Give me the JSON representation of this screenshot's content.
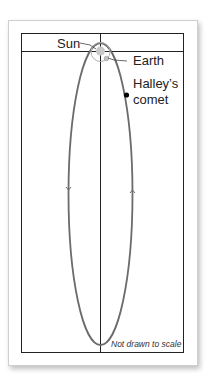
{
  "figure": {
    "labels": {
      "sun": "Sun",
      "earth": "Earth",
      "comet_line1": "Halley’s",
      "comet_line2": "comet"
    },
    "note": "Not drawn to scale",
    "colors": {
      "orbit": "#6b6b6b",
      "frame": "#222222",
      "sun": "#c8c8c8",
      "earth_orbit": "#b0b0b0",
      "comet": "#000000"
    }
  }
}
